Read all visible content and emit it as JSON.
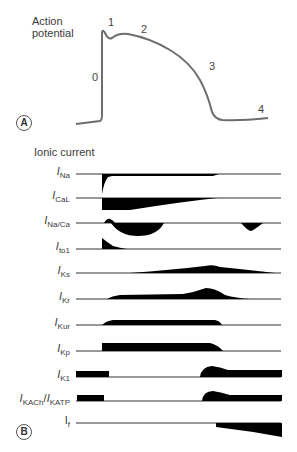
{
  "panel_a": {
    "label": "A",
    "title_line1": "Action",
    "title_line2": "potential",
    "phases": [
      "0",
      "1",
      "2",
      "3",
      "4"
    ]
  },
  "panel_b": {
    "label": "B",
    "title": "Ionic current",
    "currents": [
      {
        "main": "I",
        "sub": "Na"
      },
      {
        "main": "I",
        "sub": "CaL"
      },
      {
        "main": "I",
        "sub": "Na/Ca"
      },
      {
        "main": "I",
        "sub": "to1"
      },
      {
        "main": "I",
        "sub": "Ks"
      },
      {
        "main": "I",
        "sub": "Kr"
      },
      {
        "main": "I",
        "sub": "Kur"
      },
      {
        "main": "I",
        "sub": "Kp"
      },
      {
        "main": "I",
        "sub": "K1"
      },
      {
        "main": "I",
        "sub": "KACh",
        "sep": "/",
        "main2": "I",
        "sub2": "KATP"
      },
      {
        "main": "I",
        "sub": "f"
      }
    ]
  },
  "colors": {
    "trace": "#6e6e6e",
    "fill": "#000000",
    "baseline": "#333333"
  }
}
